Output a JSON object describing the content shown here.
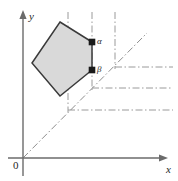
{
  "figure": {
    "background_color": "#ffffff",
    "width": 178,
    "height": 181
  },
  "axes": {
    "origin_label": "0",
    "origin_position": {
      "x": 23,
      "y": 158
    },
    "x_axis": {
      "label": "x",
      "color": "#6b6b6b",
      "start": {
        "x": 8,
        "y": 158
      },
      "end": {
        "x": 168,
        "y": 158
      },
      "arrow": "right"
    },
    "y_axis": {
      "label": "y",
      "color": "#6b6b6b",
      "start": {
        "x": 23,
        "y": 176
      },
      "end": {
        "x": 23,
        "y": 12
      },
      "arrow": "up"
    }
  },
  "polygon": {
    "name": "shaded-pentagon",
    "fill_color": "#d9d9d9",
    "stroke_color": "#3a3a3a",
    "vertices": [
      {
        "x": 60,
        "y": 22
      },
      {
        "x": 92,
        "y": 42
      },
      {
        "x": 92,
        "y": 70
      },
      {
        "x": 60,
        "y": 96
      },
      {
        "x": 32,
        "y": 63
      }
    ],
    "points_path": "60,22 92,42 92,70 60,96 32,63"
  },
  "points": [
    {
      "id": "alpha",
      "label": "α",
      "x": 92,
      "y": 42,
      "marker": "filled-square",
      "color": "#1a1a1a"
    },
    {
      "id": "beta",
      "label": "β",
      "x": 92,
      "y": 70,
      "marker": "filled-square",
      "color": "#1a1a1a"
    }
  ],
  "construction_lines": {
    "color": "#9a9a9a",
    "style": "dash-dot",
    "diagonal": {
      "name": "identity-diagonal",
      "from": {
        "x": 23,
        "y": 158
      },
      "to": {
        "x": 147,
        "y": 33
      }
    },
    "verticals": [
      {
        "id": "vertical-left",
        "x": 68,
        "y_top": 12,
        "y_bottom": 112
      },
      {
        "id": "vertical-middle",
        "x": 92,
        "y_top": 12,
        "y_bottom": 90
      },
      {
        "id": "vertical-right",
        "x": 115,
        "y_top": 12,
        "y_bottom": 69
      }
    ],
    "horizontals": [
      {
        "id": "horizontal-upper",
        "y": 67,
        "x_start": 115,
        "x_end": 173
      },
      {
        "id": "horizontal-middle",
        "y": 88,
        "x_start": 92,
        "x_end": 173
      },
      {
        "id": "horizontal-lower",
        "y": 110,
        "x_start": 68,
        "x_end": 173
      }
    ]
  }
}
